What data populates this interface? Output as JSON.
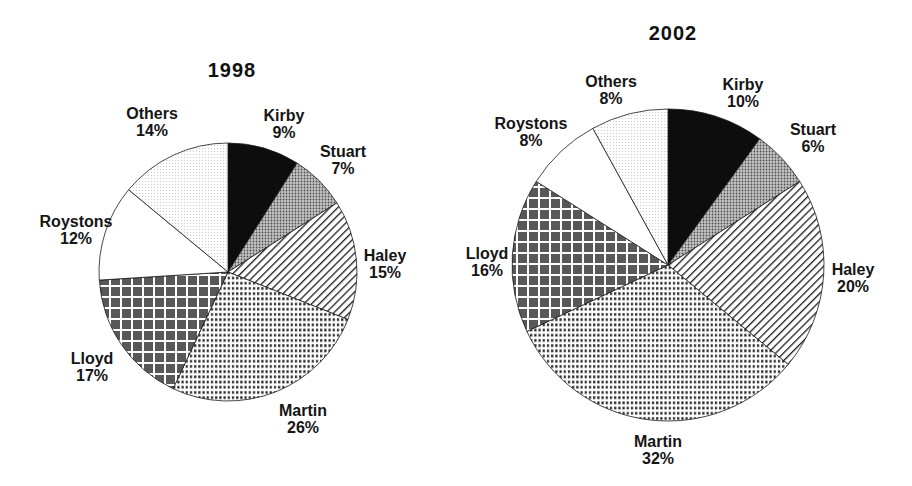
{
  "page": {
    "background": "#ffffff"
  },
  "colors": {
    "ink": "#1b1b1b",
    "solid_black": "#0d0d0d",
    "checker_dark": "#585858",
    "halftone_mid": "#9a9a9a",
    "speckle_light": "#c4c4c4",
    "white": "#ffffff"
  },
  "chart_data": [
    {
      "type": "pie",
      "title": "1998",
      "unit": "%",
      "start_angle_deg": 0,
      "direction": "clockwise",
      "slices": [
        {
          "label": "Kirby",
          "value": 9,
          "pattern": "solid-black"
        },
        {
          "label": "Stuart",
          "value": 7,
          "pattern": "gray-halftone"
        },
        {
          "label": "Haley",
          "value": 15,
          "pattern": "diagonal-stripes"
        },
        {
          "label": "Martin",
          "value": 26,
          "pattern": "fine-dots"
        },
        {
          "label": "Lloyd",
          "value": 17,
          "pattern": "dark-checker"
        },
        {
          "label": "Roystons",
          "value": 12,
          "pattern": "white"
        },
        {
          "label": "Others",
          "value": 14,
          "pattern": "light-speckle"
        }
      ],
      "layout": {
        "cx": 228,
        "cy": 272,
        "r": 129,
        "title_pos": [
          232,
          70
        ],
        "label_positions": {
          "Kirby": [
            284,
            124
          ],
          "Stuart": [
            343,
            160
          ],
          "Haley": [
            385,
            264
          ],
          "Martin": [
            303,
            419
          ],
          "Lloyd": [
            92,
            367
          ],
          "Roystons": [
            76,
            230
          ],
          "Others": [
            152,
            122
          ]
        }
      }
    },
    {
      "type": "pie",
      "title": "2002",
      "unit": "%",
      "start_angle_deg": 0,
      "direction": "clockwise",
      "slices": [
        {
          "label": "Kirby",
          "value": 10,
          "pattern": "solid-black"
        },
        {
          "label": "Stuart",
          "value": 6,
          "pattern": "gray-halftone"
        },
        {
          "label": "Haley",
          "value": 20,
          "pattern": "diagonal-stripes"
        },
        {
          "label": "Martin",
          "value": 32,
          "pattern": "fine-dots"
        },
        {
          "label": "Lloyd",
          "value": 16,
          "pattern": "dark-checker"
        },
        {
          "label": "Roystons",
          "value": 8,
          "pattern": "white"
        },
        {
          "label": "Others",
          "value": 8,
          "pattern": "light-speckle"
        }
      ],
      "layout": {
        "cx": 668,
        "cy": 265,
        "r": 156,
        "title_pos": [
          673,
          33
        ],
        "label_positions": {
          "Kirby": [
            743,
            93
          ],
          "Stuart": [
            813,
            138
          ],
          "Haley": [
            853,
            278
          ],
          "Martin": [
            658,
            450
          ],
          "Lloyd": [
            487,
            262
          ],
          "Roystons": [
            531,
            132
          ],
          "Others": [
            611,
            90
          ]
        }
      }
    }
  ]
}
